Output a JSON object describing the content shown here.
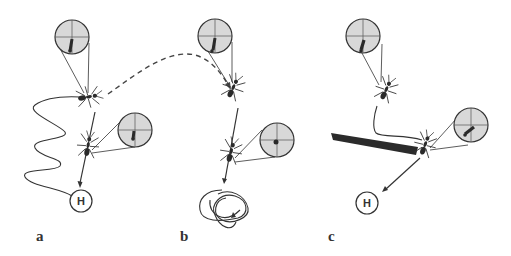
{
  "figure": {
    "colors": {
      "line": "#333333",
      "inset_fill": "#d8d8d8",
      "ant": "#2a2a2a",
      "barrier": "#2b2b2b",
      "background": "#ffffff"
    },
    "panels": [
      {
        "id": "a",
        "label": "a",
        "home_label": "H"
      },
      {
        "id": "b",
        "label": "b"
      },
      {
        "id": "c",
        "label": "c",
        "home_label": "H"
      }
    ]
  }
}
